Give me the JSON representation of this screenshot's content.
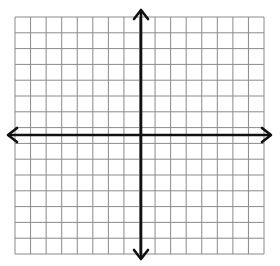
{
  "diagram": {
    "type": "coordinate-plane",
    "title": "",
    "grid": {
      "columns": 16,
      "rows": 15,
      "left": 15,
      "top": 17,
      "right": 264,
      "bottom": 254,
      "line_color": "#8a8a8a"
    },
    "axes": {
      "x_axis": {
        "y": 135,
        "x_start": 8,
        "x_end": 271,
        "arrows": [
          "left",
          "right"
        ]
      },
      "y_axis": {
        "x": 141,
        "y_start": 10,
        "y_end": 259,
        "arrows": [
          "up",
          "down"
        ]
      },
      "color": "#111111"
    },
    "labels": []
  }
}
